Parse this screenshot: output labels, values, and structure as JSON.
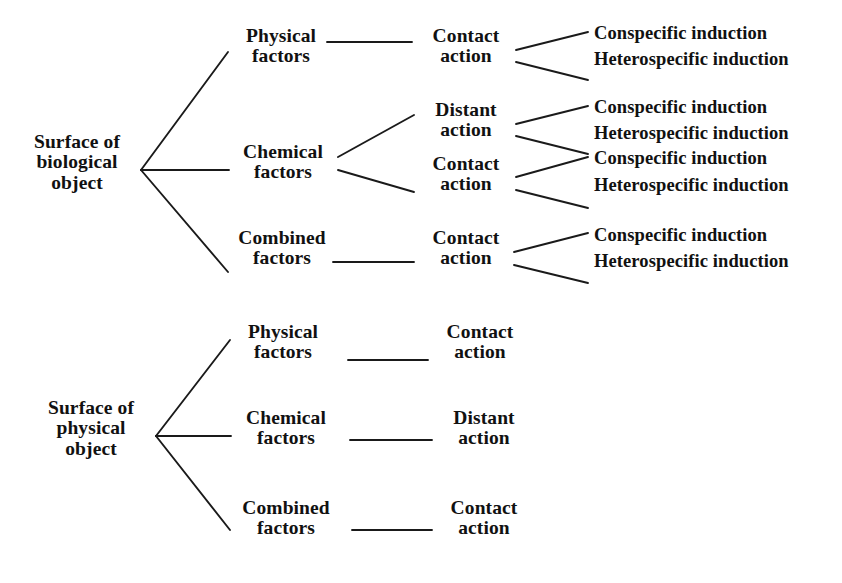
{
  "diagram": {
    "type": "tree-diagram",
    "line_color": "#1a1a1a",
    "text_color": "#111111",
    "background": "#ffffff"
  },
  "trees": [
    {
      "id": "biological",
      "root": {
        "label": "Surface of\nbiological\nobject"
      },
      "branches": [
        {
          "factor": "Physical\nfactors",
          "actions": [
            {
              "label": "Contact\naction",
              "leaves": [
                "Conspecific induction",
                "Heterospecific induction"
              ]
            }
          ]
        },
        {
          "factor": "Chemical\nfactors",
          "actions": [
            {
              "label": "Distant\naction",
              "leaves": [
                "Conspecific induction",
                "Heterospecific induction"
              ]
            },
            {
              "label": "Contact\naction",
              "leaves": [
                "Conspecific induction",
                "Heterospecific induction"
              ]
            }
          ]
        },
        {
          "factor": "Combined\nfactors",
          "actions": [
            {
              "label": "Contact\naction",
              "leaves": [
                "Conspecific induction",
                "Heterospecific induction"
              ]
            }
          ]
        }
      ]
    },
    {
      "id": "physical",
      "root": {
        "label": "Surface of\nphysical\nobject"
      },
      "branches": [
        {
          "factor": "Physical\nfactors",
          "actions": [
            {
              "label": "Contact\naction",
              "leaves": []
            }
          ]
        },
        {
          "factor": "Chemical\nfactors",
          "actions": [
            {
              "label": "Distant\naction",
              "leaves": []
            }
          ]
        },
        {
          "factor": "Combined\nfactors",
          "actions": [
            {
              "label": "Contact\naction",
              "leaves": []
            }
          ]
        }
      ]
    }
  ]
}
